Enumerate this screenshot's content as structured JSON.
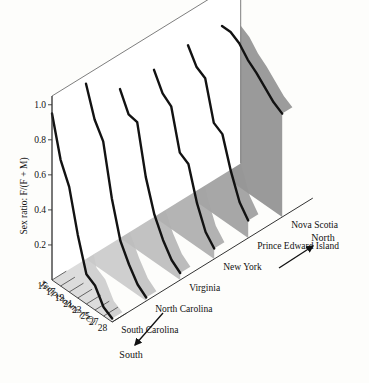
{
  "figure": {
    "type": "3d-ribbon-surface",
    "y_axis": {
      "label": "Sex ratio: F/(F + M)",
      "ticks": [
        "0.2",
        "0.4",
        "0.6",
        "0.8",
        "1.0"
      ],
      "tick_values": [
        0.2,
        0.4,
        0.6,
        0.8,
        1.0
      ],
      "range": [
        0,
        1.05
      ]
    },
    "x_axis": {
      "label": "Temperature (°C)",
      "ticks": [
        "15",
        "17",
        "19",
        "21",
        "23",
        "25",
        "27",
        "28"
      ],
      "tick_values": [
        15,
        17,
        19,
        21,
        23,
        25,
        27,
        28
      ]
    },
    "z_axis": {
      "categories": [
        "South Carolina",
        "North Carolina",
        "Virginia",
        "New York",
        "Prince Edward Island",
        "Nova Scotia"
      ]
    },
    "direction_labels": {
      "near": "South",
      "far": "North"
    },
    "colors": {
      "ribbon_front": "#dcdcdc",
      "ribbon_back": "#9a9a9a",
      "curve": "#121212",
      "grid": "#8e8e8e",
      "frame": "#6f6f6f",
      "background": "#fdfdfb"
    }
  },
  "chart_data": {
    "type": "line",
    "title": "",
    "subtitle": "",
    "xlabel": "Temperature (°C)",
    "ylabel": "Sex ratio: F/(F + M)",
    "zlabel": "Population (South to North)",
    "x": [
      15,
      17,
      19,
      21,
      23,
      25,
      27,
      28
    ],
    "xlim": [
      15,
      28
    ],
    "ylim": [
      0,
      1.05
    ],
    "grid": true,
    "legend": "none",
    "annotations": [
      "South",
      "North"
    ],
    "series": [
      {
        "name": "South Carolina",
        "values": [
          0.95,
          0.72,
          0.6,
          0.36,
          0.17,
          0.14,
          0.05,
          0.02
        ]
      },
      {
        "name": "North Carolina",
        "values": [
          1.0,
          0.83,
          0.74,
          0.45,
          0.24,
          0.14,
          0.06,
          0.02
        ]
      },
      {
        "name": "Virginia",
        "values": [
          0.85,
          0.74,
          0.73,
          0.45,
          0.27,
          0.16,
          0.08,
          0.04
        ]
      },
      {
        "name": "New York",
        "values": [
          0.84,
          0.74,
          0.7,
          0.47,
          0.44,
          0.25,
          0.12,
          0.06
        ]
      },
      {
        "name": "Prince Edward Island",
        "values": [
          0.86,
          0.77,
          0.74,
          0.52,
          0.49,
          0.31,
          0.17,
          0.1
        ]
      },
      {
        "name": "Nova Scotia",
        "values": [
          0.85,
          0.85,
          0.82,
          0.76,
          0.72,
          0.67,
          0.62,
          0.59
        ]
      }
    ]
  }
}
